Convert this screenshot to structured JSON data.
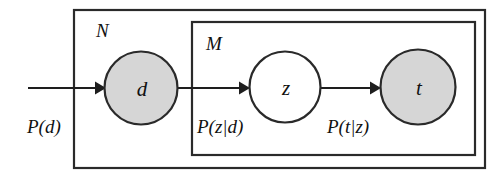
{
  "diagram": {
    "background_color": "#ffffff",
    "stroke_color": "#2a2a2a",
    "observed_fill_color": "#d6d6d6",
    "latent_fill_color": "#ffffff",
    "plates": [
      {
        "id": "plate-n",
        "label": "N",
        "x": 74,
        "y": 10,
        "width": 411,
        "height": 158
      },
      {
        "id": "plate-m",
        "label": "M",
        "x": 192,
        "y": 22,
        "width": 283,
        "height": 133
      }
    ],
    "nodes": [
      {
        "id": "node-d",
        "label": "d",
        "cx": 141,
        "cy": 88,
        "r": 36.5,
        "shaded": true,
        "fill": "#d6d6d6"
      },
      {
        "id": "node-z",
        "label": "z",
        "cx": 285,
        "cy": 87,
        "r": 35.5,
        "shaded": false,
        "fill": "#ffffff"
      },
      {
        "id": "node-t",
        "label": "t",
        "cx": 418,
        "cy": 87,
        "r": 37.5,
        "shaded": true,
        "fill": "#d6d6d6"
      }
    ],
    "edges": [
      {
        "id": "edge-prior-d",
        "label": "P(d)",
        "from": null,
        "to": "node-d",
        "x1": 28,
        "x2": 103,
        "y": 88,
        "label_x": 27,
        "label_y": 130
      },
      {
        "id": "edge-d-z",
        "label": "P(z|d)",
        "from": "node-d",
        "to": "node-z",
        "x1": 179,
        "x2": 247,
        "y": 88,
        "label_x": 197,
        "label_y": 130
      },
      {
        "id": "edge-z-t",
        "label": "P(t|z)",
        "from": "node-z",
        "to": "node-t",
        "x1": 323,
        "x2": 378,
        "y": 88,
        "label_x": 327,
        "label_y": 130
      }
    ]
  }
}
